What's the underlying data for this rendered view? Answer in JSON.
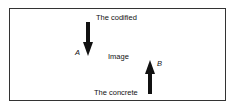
{
  "diagram": {
    "top_label": "The codified",
    "center_label": "Image",
    "bottom_label": "The concrete",
    "arrow_a": {
      "label": "A",
      "direction": "down"
    },
    "arrow_b": {
      "label": "B",
      "direction": "up"
    },
    "colors": {
      "stroke": "#111111",
      "border": "#333333",
      "background": "#ffffff"
    }
  }
}
